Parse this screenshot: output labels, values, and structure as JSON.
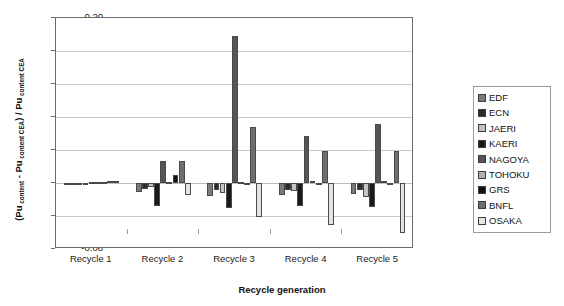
{
  "chart_data": {
    "type": "bar",
    "title": "",
    "xlabel": "Recycle generation",
    "ylabel": "(Pu content - Pu content CEA) / Pu content CEA",
    "categories": [
      "Recycle 1",
      "Recycle 2",
      "Recycle 3",
      "Recycle 4",
      "Recycle 5"
    ],
    "ylim": [
      -0.08,
      0.2
    ],
    "ytick_labels": [
      "0.20",
      "0.16",
      "0.12",
      "0.08",
      "0.04",
      "0.00",
      "-0.04",
      "-0.08"
    ],
    "ytick_values": [
      0.2,
      0.16,
      0.12,
      0.08,
      0.04,
      0.0,
      -0.04,
      -0.08
    ],
    "grid": true,
    "legend_position": "right",
    "series": [
      {
        "name": "EDF",
        "color": "#7a7a7a",
        "values": [
          0.0,
          -0.011,
          -0.016,
          -0.014,
          -0.013
        ]
      },
      {
        "name": "ECN",
        "color": "#2b2b2b",
        "values": [
          0.0,
          -0.007,
          -0.008,
          -0.009,
          -0.009
        ]
      },
      {
        "name": "JAERI",
        "color": "#c4c4c4",
        "values": [
          0.0,
          -0.005,
          -0.012,
          -0.01,
          -0.017
        ]
      },
      {
        "name": "KAERI",
        "color": "#1a1a1a",
        "values": [
          0.0,
          -0.028,
          -0.03,
          -0.028,
          -0.029
        ]
      },
      {
        "name": "NAGOYA",
        "color": "#555555",
        "values": [
          0.001,
          0.027,
          0.178,
          0.057,
          0.071
        ]
      },
      {
        "name": "TOHOKU",
        "color": "#b0b0b0",
        "values": [
          0.001,
          0.001,
          0.001,
          0.002,
          0.002
        ]
      },
      {
        "name": "GRS",
        "color": "#111111",
        "values": [
          0.001,
          0.01,
          0.0,
          -0.001,
          0.0
        ]
      },
      {
        "name": "BNFL",
        "color": "#6e6e6e",
        "values": [
          0.002,
          0.027,
          0.068,
          0.039,
          0.039
        ]
      },
      {
        "name": "OSAKA",
        "color": "#e3e3e3",
        "values": [
          0.002,
          -0.014,
          -0.041,
          -0.051,
          -0.061
        ]
      }
    ]
  },
  "legend": {
    "items": [
      {
        "label": "EDF"
      },
      {
        "label": "ECN"
      },
      {
        "label": "JAERI"
      },
      {
        "label": "KAERI"
      },
      {
        "label": "NAGOYA"
      },
      {
        "label": "TOHOKU"
      },
      {
        "label": "GRS"
      },
      {
        "label": "BNFL"
      },
      {
        "label": "OSAKA"
      }
    ]
  },
  "axis": {
    "y_title_main": "(Pu",
    "y_title_full": "(Pu content - Pu content CEA) / Pu content CEA",
    "x_title": "Recycle generation"
  }
}
